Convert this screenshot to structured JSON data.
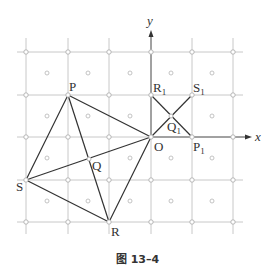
{
  "figure": {
    "caption": "图 13–4",
    "axes": {
      "x_label": "x",
      "y_label": "y"
    },
    "grid": {
      "x_lines": [
        26,
        68,
        109,
        151,
        192,
        233
      ],
      "y_lines": [
        52,
        95,
        137,
        180,
        222
      ]
    },
    "points": {
      "P": {
        "label": "P",
        "x": 68,
        "y": 95
      },
      "O": {
        "label": "O",
        "x": 151,
        "y": 137
      },
      "R": {
        "label": "R",
        "x": 109,
        "y": 222
      },
      "S": {
        "label": "S",
        "x": 26,
        "y": 180
      },
      "Q": {
        "label": "Q",
        "x": 89,
        "y": 159
      },
      "R1": {
        "label": "R",
        "sub": "1",
        "x": 151,
        "y": 95
      },
      "S1": {
        "label": "S",
        "sub": "1",
        "x": 192,
        "y": 95
      },
      "P1": {
        "label": "P",
        "sub": "1",
        "x": 192,
        "y": 137
      },
      "Q1": {
        "label": "Q",
        "sub": "1",
        "x": 171,
        "y": 116
      }
    },
    "segments": [
      [
        "P",
        "O"
      ],
      [
        "O",
        "R"
      ],
      [
        "R",
        "S"
      ],
      [
        "S",
        "P"
      ],
      [
        "P",
        "R"
      ],
      [
        "S",
        "O"
      ],
      [
        "R1",
        "P1"
      ],
      [
        "S1",
        "O"
      ]
    ]
  }
}
